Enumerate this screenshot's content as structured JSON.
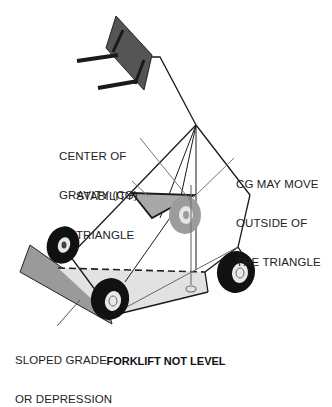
{
  "title": "FORKLIFT NOT LEVEL",
  "labels": {
    "cg": [
      "CENTER OF",
      "GRAVITY (CG)"
    ],
    "stability": [
      "STABILITY",
      "TRIANGLE"
    ],
    "cg_move": [
      "CG MAY MOVE",
      "OUTSIDE OF",
      "THE TRIANGLE"
    ],
    "slope": [
      "SLOPED GRADE",
      "OR DEPRESSION"
    ]
  },
  "colors": {
    "line": "#1a1a1a",
    "triangle_fill": "#a8a8a8",
    "slope_fill": "#9a9a9a",
    "ground_fill": "#e0e0e0",
    "fork_fill": "#555555",
    "tire": "#111111",
    "ghost_wheel": "#9c9c9c"
  }
}
